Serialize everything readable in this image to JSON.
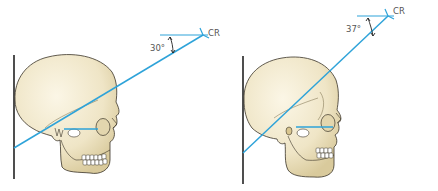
{
  "colors": {
    "beam": "#2ea3d9",
    "bone_fill": "#f2ead0",
    "bone_shade": "#e2d6ae",
    "outline": "#3a3428",
    "ir_line": "#222222",
    "text": "#555555"
  },
  "panels": [
    {
      "id": "left",
      "angle_label": "30°",
      "ray_label": "CR"
    },
    {
      "id": "right",
      "angle_label": "37°",
      "ray_label": "CR"
    }
  ]
}
